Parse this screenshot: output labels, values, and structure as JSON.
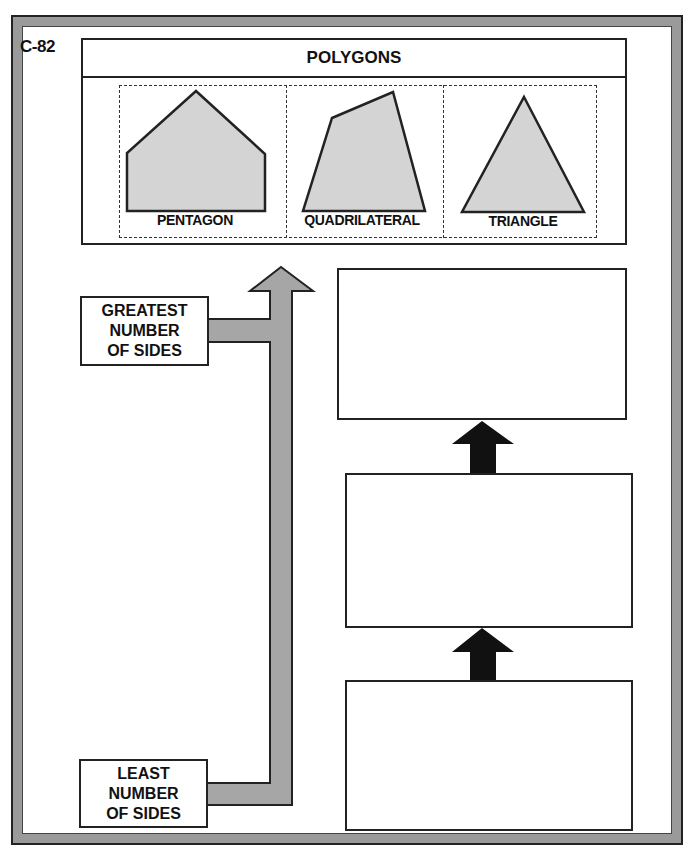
{
  "worksheet": {
    "code": "C-82",
    "title": "POLYGONS"
  },
  "shapes": [
    {
      "name": "PENTAGON",
      "sides": 5,
      "fill": "#d4d4d4"
    },
    {
      "name": "QUADRILATERAL",
      "sides": 4,
      "fill": "#d4d4d4"
    },
    {
      "name": "TRIANGLE",
      "sides": 3,
      "fill": "#d4d4d4"
    }
  ],
  "scale": {
    "top_label": [
      "GREATEST",
      "NUMBER",
      "OF SIDES"
    ],
    "bottom_label": [
      "LEAST",
      "NUMBER",
      "OF SIDES"
    ],
    "arrow_color": "#a6a6a6"
  },
  "answer_boxes": [
    {
      "position": "top",
      "value": ""
    },
    {
      "position": "middle",
      "value": ""
    },
    {
      "position": "bottom",
      "value": ""
    }
  ],
  "colors": {
    "frame": "#9a9a9a",
    "stroke": "#222222",
    "shape_fill": "#d4d4d4",
    "small_arrow": "#111111"
  }
}
